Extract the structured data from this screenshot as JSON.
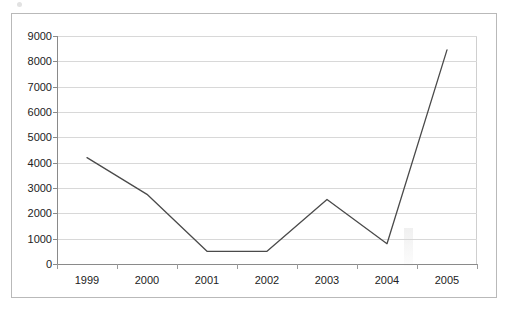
{
  "chart_data": {
    "type": "line",
    "title": "",
    "subtitle": "",
    "xlabel": "",
    "ylabel": "",
    "categories": [
      "1999",
      "2000",
      "2001",
      "2002",
      "2003",
      "2004",
      "2005"
    ],
    "values": [
      4200,
      2750,
      500,
      500,
      2550,
      800,
      8450
    ],
    "series": [
      {
        "name": "",
        "values": [
          4200,
          2750,
          500,
          500,
          2550,
          800,
          8450
        ],
        "color": "#4a4a4a"
      }
    ],
    "ylim": [
      0,
      9000
    ],
    "ytick_step": 1000,
    "yticks": [
      0,
      1000,
      2000,
      3000,
      4000,
      5000,
      6000,
      7000,
      8000,
      9000
    ],
    "ytick_labels": [
      "0",
      "1000",
      "2000",
      "3000",
      "4000",
      "5000",
      "6000",
      "7000",
      "8000",
      "9000"
    ],
    "xtick_labels": [
      "1999",
      "2000",
      "2001",
      "2002",
      "2003",
      "2004",
      "2005"
    ],
    "grid": true,
    "grid_axis": "y",
    "legend": false,
    "legend_position": "none",
    "markers": false,
    "annotations": []
  },
  "colors": {
    "line": "#4a4a4a",
    "gridline": "#d8d8d8",
    "axis": "#8a8a8a",
    "frame": "#b9b9b9",
    "text": "#222222",
    "background": "#ffffff"
  }
}
